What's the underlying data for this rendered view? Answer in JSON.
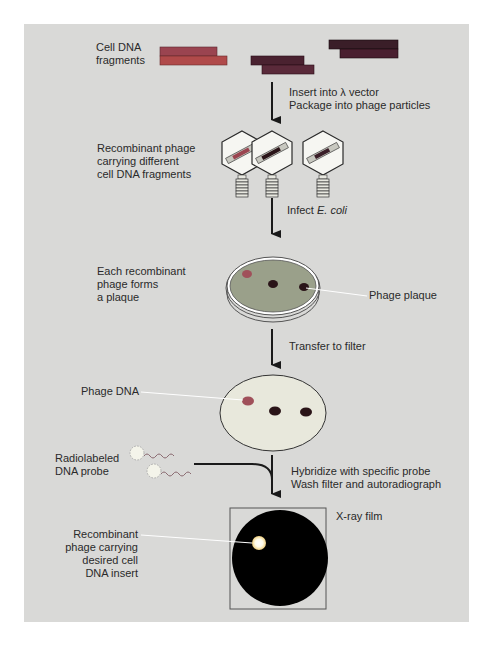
{
  "diagram": {
    "steps": [
      {
        "id": "fragments",
        "label_line1": "Cell DNA",
        "label_line2": "fragments"
      },
      {
        "id": "package",
        "arrow_label_line1": "Insert into λ vector",
        "arrow_label_line2": "Package into phage particles"
      },
      {
        "id": "recombinant-phage",
        "label_line1": "Recombinant phage",
        "label_line2": "carrying different",
        "label_line3": "cell DNA fragments"
      },
      {
        "id": "infect",
        "arrow_label_prefix": "Infect ",
        "arrow_label_italic": "E. coli"
      },
      {
        "id": "plaques",
        "label_line1": "Each recombinant",
        "label_line2": "phage forms",
        "label_line3": "a plaque",
        "callout": "Phage plaque"
      },
      {
        "id": "transfer",
        "arrow_label": "Transfer to filter"
      },
      {
        "id": "filter",
        "callout": "Phage DNA"
      },
      {
        "id": "probe",
        "label_line1": "Radiolabeled",
        "label_line2": "DNA probe",
        "arrow_label_line1": "Hybridize with specific probe",
        "arrow_label_line2": "Wash filter and autoradiograph"
      },
      {
        "id": "film",
        "film_label": "X-ray film",
        "callout_line1": "Recombinant",
        "callout_line2": "phage carrying",
        "callout_line3": "desired cell",
        "callout_line4": "DNA insert"
      }
    ],
    "colors": {
      "background": "#d9d9d7",
      "fragment_red": "#b04a4a",
      "fragment_purple": "#5a2a3e",
      "fragment_dark": "#3a1e28",
      "dish_agar": "#9aa08a",
      "filter": "#e8e8dc",
      "plaque_light": "#a0505a",
      "plaque_dark": "#2a1418",
      "film": "#000000",
      "arrow": "#1a1a1a"
    }
  }
}
